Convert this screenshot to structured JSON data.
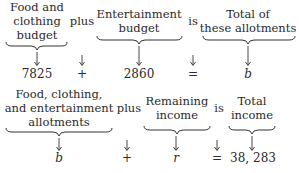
{
  "equation_1": {
    "terms": [
      {
        "label_lines": [
          "Food and",
          "clothing",
          "budget"
        ],
        "value": "7825"
      },
      {
        "label_lines": [
          "plus"
        ],
        "value": "+"
      },
      {
        "label_lines": [
          "Entertainment",
          "budget"
        ],
        "value": "2860"
      },
      {
        "label_lines": [
          "is"
        ],
        "value": "="
      },
      {
        "label_lines": [
          "Total of",
          "these allotments"
        ],
        "value": "b"
      }
    ]
  },
  "equation_2": {
    "terms": [
      {
        "label_lines": [
          "Food, clothing,",
          "and entertainment",
          "allotments"
        ],
        "value": "b"
      },
      {
        "label_lines": [
          "plus"
        ],
        "value": "+"
      },
      {
        "label_lines": [
          "Remaining",
          "income"
        ],
        "value": "r"
      },
      {
        "label_lines": [
          "is"
        ],
        "value": "="
      },
      {
        "label_lines": [
          "Total",
          "income"
        ],
        "value": "38, 283"
      }
    ]
  }
}
